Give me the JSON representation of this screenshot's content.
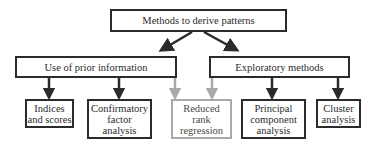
{
  "root": {
    "label": "Methods to derive patterns"
  },
  "branches": [
    {
      "label": "Use of prior information",
      "children": [
        {
          "label": "Indices\nand scores",
          "style": "black"
        },
        {
          "label": "Confirmatory\nfactor\nanalysis",
          "style": "black"
        }
      ]
    },
    {
      "label": "Exploratory methods",
      "children": [
        {
          "label": "Principal\ncomponent\nanalysis",
          "style": "black"
        },
        {
          "label": "Cluster\nanalysis",
          "style": "black"
        }
      ]
    }
  ],
  "shared_child": {
    "label": "Reduced\nrank\nregression",
    "style": "gray",
    "parents": [
      "Use of prior information",
      "Exploratory methods"
    ]
  },
  "colors": {
    "black": "#2b2b2b",
    "gray": "#a9a9a9",
    "background": "#ffffff"
  }
}
